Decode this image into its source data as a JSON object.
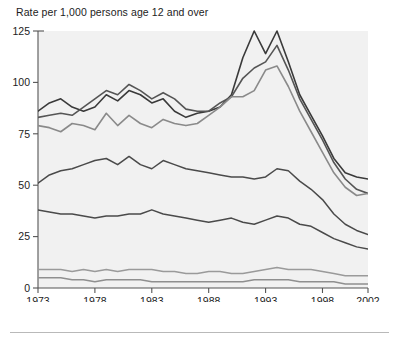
{
  "chart_data": {
    "type": "line",
    "title": "Rate per 1,000 persons age 12 and over",
    "xlabel": "Year",
    "ylabel": "",
    "xlim": [
      1973,
      2002
    ],
    "ylim": [
      0,
      125
    ],
    "ytick_labels": [
      "0",
      "25",
      "50",
      "75",
      "100",
      "125"
    ],
    "yticks": [
      0,
      25,
      50,
      75,
      100,
      125
    ],
    "xtick_labels": [
      "1973",
      "1978",
      "1983",
      "1988",
      "1993",
      "1998",
      "2002"
    ],
    "xticks": [
      1973,
      1978,
      1983,
      1988,
      1993,
      1998,
      2002
    ],
    "grid": false,
    "legend": "none",
    "x": [
      1973,
      1974,
      1975,
      1976,
      1977,
      1978,
      1979,
      1980,
      1981,
      1982,
      1983,
      1984,
      1985,
      1986,
      1987,
      1988,
      1989,
      1990,
      1991,
      1992,
      1993,
      1994,
      1995,
      1996,
      1997,
      1998,
      1999,
      2000,
      2001,
      2002
    ],
    "series": [
      {
        "name": "series-1",
        "color": "#3a3a3a",
        "width": 1.6,
        "values": [
          86,
          90,
          92,
          88,
          86,
          88,
          94,
          91,
          96,
          94,
          90,
          92,
          86,
          83,
          85,
          86,
          88,
          94,
          112,
          125,
          114,
          125,
          110,
          94,
          84,
          74,
          63,
          56,
          54,
          53
        ]
      },
      {
        "name": "series-2",
        "color": "#555555",
        "width": 1.6,
        "values": [
          83,
          84,
          85,
          84,
          88,
          92,
          96,
          94,
          99,
          96,
          92,
          95,
          92,
          87,
          86,
          86,
          90,
          93,
          102,
          107,
          110,
          118,
          106,
          92,
          82,
          72,
          61,
          53,
          48,
          46
        ]
      },
      {
        "name": "series-3",
        "color": "#8a8a8a",
        "width": 1.6,
        "values": [
          79,
          78,
          76,
          80,
          79,
          77,
          85,
          79,
          84,
          80,
          78,
          82,
          80,
          79,
          80,
          84,
          88,
          93,
          93,
          96,
          106,
          108,
          98,
          86,
          76,
          66,
          56,
          49,
          45,
          46
        ]
      },
      {
        "name": "series-4",
        "color": "#4a4a4a",
        "width": 1.5,
        "values": [
          51,
          55,
          57,
          58,
          60,
          62,
          63,
          60,
          64,
          60,
          58,
          62,
          60,
          58,
          57,
          56,
          55,
          54,
          54,
          53,
          54,
          58,
          57,
          52,
          48,
          43,
          36,
          31,
          28,
          26
        ]
      },
      {
        "name": "series-5",
        "color": "#4a4a4a",
        "width": 1.5,
        "values": [
          38,
          37,
          36,
          36,
          35,
          34,
          35,
          35,
          36,
          36,
          38,
          36,
          35,
          34,
          33,
          32,
          33,
          34,
          32,
          31,
          33,
          35,
          34,
          31,
          30,
          27,
          24,
          22,
          20,
          19
        ]
      },
      {
        "name": "series-6",
        "color": "#9a9a9a",
        "width": 1.5,
        "values": [
          9,
          9,
          9,
          8,
          9,
          8,
          9,
          8,
          9,
          9,
          9,
          8,
          8,
          7,
          7,
          8,
          8,
          7,
          7,
          8,
          9,
          10,
          9,
          9,
          9,
          8,
          7,
          6,
          6,
          6
        ]
      },
      {
        "name": "series-7",
        "color": "#8f8f8f",
        "width": 1.5,
        "values": [
          5,
          5,
          5,
          4,
          4,
          3,
          4,
          4,
          4,
          4,
          3,
          3,
          3,
          3,
          3,
          3,
          3,
          3,
          3,
          4,
          4,
          4,
          4,
          3,
          3,
          3,
          3,
          2,
          2,
          2
        ]
      }
    ]
  }
}
